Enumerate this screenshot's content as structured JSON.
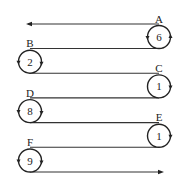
{
  "diagram": {
    "nodes": [
      {
        "label": "A",
        "value": "6",
        "side": "right",
        "rotation": "counterclockwise"
      },
      {
        "label": "B",
        "value": "2",
        "side": "left",
        "rotation": "counterclockwise"
      },
      {
        "label": "C",
        "value": "1",
        "side": "right",
        "rotation": "clockwise"
      },
      {
        "label": "D",
        "value": "8",
        "side": "left",
        "rotation": "counterclockwise"
      },
      {
        "label": "E",
        "value": "1",
        "side": "right",
        "rotation": "clockwise"
      },
      {
        "label": "F",
        "value": "9",
        "side": "left",
        "rotation": "counterclockwise"
      }
    ],
    "start_arrow_direction": "left",
    "end_arrow_direction": "right"
  }
}
